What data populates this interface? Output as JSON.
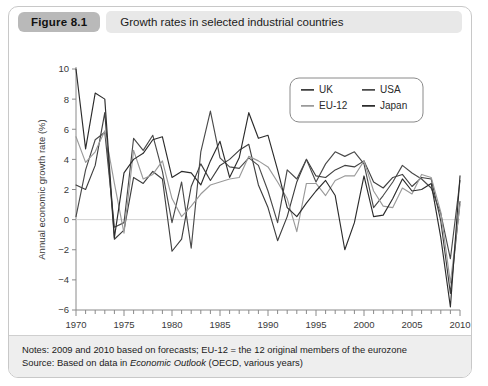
{
  "figure": {
    "badge": "Figure 8.1",
    "title": "Growth rates in selected industrial countries"
  },
  "notes": {
    "line1_prefix": "Notes: 2009 and 2010 based on forecasts; EU-12 = the 12 original members of the eurozone",
    "line2_prefix": "Source: Based on data in ",
    "line2_italic": "Economic Outlook",
    "line2_suffix": " (OECD, various years)"
  },
  "colors": {
    "uk": "#3f3f3f",
    "usa": "#4a4a4a",
    "eu12": "#9a9a9a",
    "japan": "#2c2c2c",
    "axis": "#8a8a8a",
    "zero": "#d0d0d0",
    "badge_bg": "#b9b9b9",
    "title_bg": "#e8e8e8",
    "footer_bg": "#eeeeee"
  },
  "chart_data": {
    "type": "line",
    "title": "Growth rates in selected industrial countries",
    "xlabel": "",
    "ylabel": "Annual economic growth rate (%)",
    "xlim": [
      1970,
      2010
    ],
    "ylim": [
      -6,
      10
    ],
    "ytick_step": 2,
    "yticks": [
      -6,
      -4,
      -2,
      0,
      2,
      4,
      6,
      8,
      10
    ],
    "xticks": [
      1970,
      1975,
      1980,
      1985,
      1990,
      1995,
      2000,
      2005,
      2010
    ],
    "x_minor_tick_step": 1,
    "grid": false,
    "zero_line": true,
    "legend_position": "top-right",
    "x": [
      1970,
      1971,
      1972,
      1973,
      1974,
      1975,
      1976,
      1977,
      1978,
      1979,
      1980,
      1981,
      1982,
      1983,
      1984,
      1985,
      1986,
      1987,
      1988,
      1989,
      1990,
      1991,
      1992,
      1993,
      1994,
      1995,
      1996,
      1997,
      1998,
      1999,
      2000,
      2001,
      2002,
      2003,
      2004,
      2005,
      2006,
      2007,
      2008,
      2009,
      2010
    ],
    "series": [
      {
        "name": "UK",
        "color": "#3f3f3f",
        "values": [
          2.3,
          2.0,
          3.6,
          7.1,
          -1.3,
          -0.7,
          2.8,
          2.4,
          3.2,
          2.7,
          -2.1,
          -1.3,
          2.2,
          3.7,
          2.6,
          3.6,
          4.0,
          4.6,
          5.0,
          2.3,
          0.8,
          -1.4,
          0.2,
          2.5,
          4.0,
          2.9,
          2.8,
          3.3,
          3.6,
          3.5,
          3.9,
          2.5,
          2.1,
          2.8,
          3.0,
          2.2,
          2.8,
          2.7,
          -0.1,
          -4.9,
          1.2
        ]
      },
      {
        "name": "USA",
        "color": "#4a4a4a",
        "values": [
          0.2,
          3.3,
          5.3,
          5.8,
          -0.5,
          -0.2,
          5.4,
          4.6,
          5.6,
          3.2,
          -0.2,
          2.5,
          -1.9,
          4.5,
          7.2,
          4.1,
          3.5,
          3.4,
          4.1,
          3.6,
          1.9,
          -0.2,
          3.3,
          2.7,
          4.0,
          2.5,
          3.7,
          4.5,
          4.2,
          4.5,
          3.7,
          0.8,
          1.6,
          2.5,
          3.6,
          3.1,
          2.7,
          2.1,
          0.4,
          -2.6,
          2.6
        ]
      },
      {
        "name": "EU-12",
        "color": "#9a9a9a",
        "values": [
          5.5,
          3.8,
          4.5,
          5.9,
          2.4,
          -0.9,
          4.6,
          2.7,
          3.0,
          3.9,
          1.4,
          0.2,
          0.9,
          1.7,
          2.3,
          2.5,
          2.7,
          2.8,
          4.2,
          3.9,
          3.5,
          2.5,
          1.4,
          -0.8,
          2.4,
          2.4,
          1.6,
          2.6,
          2.9,
          2.9,
          3.9,
          1.9,
          0.9,
          0.8,
          2.1,
          1.7,
          3.0,
          2.8,
          0.5,
          -4.2,
          1.0
        ]
      },
      {
        "name": "Japan",
        "color": "#2c2c2c",
        "values": [
          10.0,
          4.7,
          8.4,
          8.0,
          -1.2,
          3.1,
          4.0,
          4.4,
          5.3,
          5.5,
          2.8,
          3.2,
          3.1,
          2.3,
          3.9,
          5.2,
          2.8,
          4.1,
          7.1,
          5.4,
          5.6,
          3.3,
          0.8,
          0.2,
          1.1,
          1.9,
          2.6,
          1.6,
          -2.0,
          -0.2,
          2.9,
          0.2,
          0.3,
          1.4,
          2.7,
          1.9,
          2.0,
          2.4,
          -1.2,
          -5.8,
          2.9
        ]
      }
    ]
  }
}
